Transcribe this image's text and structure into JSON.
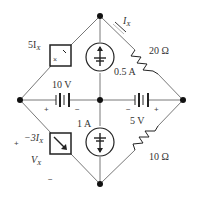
{
  "diagram": {
    "type": "circuit-schematic",
    "nodes": [
      {
        "id": "top",
        "x": 100,
        "y": 16
      },
      {
        "id": "left",
        "x": 20,
        "y": 100
      },
      {
        "id": "right",
        "x": 183,
        "y": 100
      },
      {
        "id": "bottom",
        "x": 100,
        "y": 184
      },
      {
        "id": "center",
        "x": 100,
        "y": 100
      }
    ],
    "components": {
      "dep_source_top": {
        "label_main": "5I",
        "label_sub": "X",
        "type": "dependent-voltage-source"
      },
      "current_source_top": {
        "label": "0.5 A",
        "direction": "up"
      },
      "resistor_top": {
        "label": "20 Ω"
      },
      "current_indicator": {
        "label_main": "I",
        "label_sub": "X"
      },
      "battery_left": {
        "label": "10 V",
        "plus": "+",
        "minus": "−"
      },
      "battery_right": {
        "label": "5 V",
        "plus": "+",
        "minus": "−"
      },
      "dep_source_bottom": {
        "label_main": "−3I",
        "label_sub": "X",
        "type": "dependent-current-source"
      },
      "voltage_label": {
        "label_main": "V",
        "label_sub": "X",
        "plus": "+",
        "minus": "−"
      },
      "current_source_bottom": {
        "label": "1 A",
        "direction": "down"
      },
      "resistor_bottom": {
        "label": "10 Ω"
      }
    },
    "colors": {
      "wire": "#555555",
      "component": "#222222",
      "text": "#333333",
      "background": "#ffffff"
    }
  }
}
